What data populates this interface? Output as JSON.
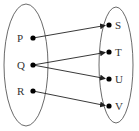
{
  "diagram": {
    "type": "mapping",
    "domain_set": {
      "ellipse": {
        "cx": 26,
        "cy": 65,
        "rx": 22,
        "ry": 61
      },
      "elements": [
        {
          "label": "P",
          "x": 33,
          "y": 38
        },
        {
          "label": "Q",
          "x": 33,
          "y": 65
        },
        {
          "label": "R",
          "x": 33,
          "y": 91
        }
      ]
    },
    "codomain_set": {
      "ellipse": {
        "cx": 116,
        "cy": 65,
        "rx": 17,
        "ry": 58
      },
      "elements": [
        {
          "label": "S",
          "x": 109,
          "y": 25
        },
        {
          "label": "T",
          "x": 109,
          "y": 52
        },
        {
          "label": "U",
          "x": 109,
          "y": 79
        },
        {
          "label": "V",
          "x": 109,
          "y": 106
        }
      ]
    },
    "arrows": [
      {
        "from": "P",
        "to": "S"
      },
      {
        "from": "Q",
        "to": "T"
      },
      {
        "from": "Q",
        "to": "U"
      },
      {
        "from": "R",
        "to": "V"
      }
    ],
    "colors": {
      "stroke": "#333333",
      "dot": "#000000"
    }
  }
}
